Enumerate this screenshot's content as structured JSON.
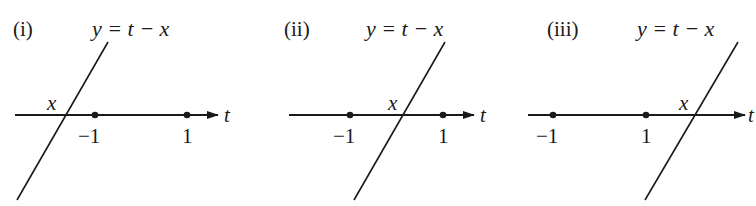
{
  "figure": {
    "panels": [
      {
        "id": "i",
        "label": "(i)",
        "equation": "y = t − x",
        "axis_label": "t",
        "intersection_label": "x",
        "ticks": [
          {
            "label": "−1",
            "value": -1
          },
          {
            "label": "1",
            "value": 1
          }
        ],
        "case": "x < −1"
      },
      {
        "id": "ii",
        "label": "(ii)",
        "equation": "y = t − x",
        "axis_label": "t",
        "intersection_label": "x",
        "ticks": [
          {
            "label": "−1",
            "value": -1
          },
          {
            "label": "1",
            "value": 1
          }
        ],
        "case": "−1 < x < 1"
      },
      {
        "id": "iii",
        "label": "(iii)",
        "equation": "y = t − x",
        "axis_label": "t",
        "intersection_label": "x",
        "ticks": [
          {
            "label": "−1",
            "value": -1
          },
          {
            "label": "1",
            "value": 1
          }
        ],
        "case": "x > 1"
      }
    ],
    "colors": {
      "ink": "#1a1a1a",
      "background": "#ffffff"
    }
  }
}
